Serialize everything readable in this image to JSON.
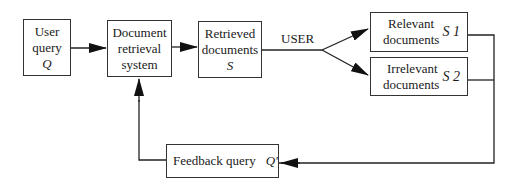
{
  "diagram": {
    "nodes": {
      "user_query": {
        "lines": [
          "User",
          "query"
        ],
        "symbol": "Q"
      },
      "retrieval_system": {
        "lines": [
          "Document",
          "retrieval",
          "system"
        ]
      },
      "retrieved_docs": {
        "lines": [
          "Retrieved",
          "documents"
        ],
        "symbol": "S"
      },
      "relevant_docs": {
        "lines": [
          "Relevant",
          "documents"
        ],
        "symbol": "S 1"
      },
      "irrelevant_docs": {
        "lines": [
          "Irrelevant",
          "documents"
        ],
        "symbol": "S 2"
      },
      "feedback_query": {
        "label": "Feedback query",
        "symbol": "Q'"
      }
    },
    "edge_labels": {
      "user": "USER"
    }
  }
}
